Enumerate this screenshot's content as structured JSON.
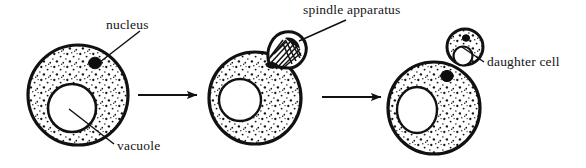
{
  "figure": {
    "stroke_color": "#111111",
    "fill_color": "#ffffff",
    "stipple_color": "#1a1a1a"
  },
  "labels": {
    "nucleus": "nucleus",
    "vacuole": "vacuole",
    "spindle_apparatus": "spindle apparatus",
    "daughter_cell": "daughter cell"
  },
  "stages": [
    {
      "name": "stage-1-parent-cell",
      "cell": {
        "cx": 78,
        "cy": 95,
        "r": 50
      },
      "nucleus": {
        "cx": 95,
        "cy": 63,
        "r": 6
      },
      "vacuole": {
        "cx": 72,
        "cy": 108,
        "r": 24
      },
      "bud": null
    },
    {
      "name": "stage-2-spindle-apparatus",
      "cell": {
        "cx": 255,
        "cy": 98,
        "r": 46
      },
      "nucleus": null,
      "vacuole": {
        "cx": 240,
        "cy": 100,
        "r": 21
      },
      "bud": {
        "cx": 283,
        "cy": 48,
        "r": 17,
        "contents": "spindle-fibers"
      }
    },
    {
      "name": "stage-3-daughter-cell",
      "cell": {
        "cx": 434,
        "cy": 108,
        "r": 46
      },
      "nucleus": {
        "cx": 447,
        "cy": 75,
        "r": 6
      },
      "vacuole": {
        "cx": 417,
        "cy": 110,
        "r": 21
      },
      "bud": {
        "cx": 465,
        "cy": 47,
        "r": 18,
        "contents": "nucleus-and-vacuole"
      }
    }
  ],
  "arrows": [
    {
      "name": "arrow-stage1-to-stage2",
      "x1": 138,
      "y1": 95,
      "x2": 198,
      "y2": 95
    },
    {
      "name": "arrow-stage2-to-stage3",
      "x1": 322,
      "y1": 97,
      "x2": 382,
      "y2": 97
    }
  ],
  "leader_lines": [
    {
      "name": "leader-nucleus",
      "x1": 140,
      "y1": 31,
      "x2": 100,
      "y2": 62
    },
    {
      "name": "leader-vacuole",
      "x1": 69,
      "y1": 109,
      "x2": 114,
      "y2": 144
    },
    {
      "name": "leader-spindle",
      "x1": 346,
      "y1": 20,
      "x2": 299,
      "y2": 41
    },
    {
      "name": "leader-daughter",
      "x1": 484,
      "y1": 62,
      "x2": 462,
      "y2": 47
    }
  ]
}
